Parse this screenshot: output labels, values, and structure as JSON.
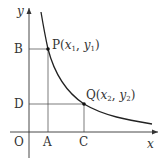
{
  "diagram": {
    "axis_labels": {
      "x": "x",
      "y": "y",
      "origin": "O"
    },
    "points": {
      "P": {
        "name": "P",
        "open": "(",
        "x": "x",
        "x_sub": "1",
        "sep": ", ",
        "y": "y",
        "y_sub": "1",
        "close": ")"
      },
      "Q": {
        "name": "Q",
        "open": "(",
        "x": "x",
        "x_sub": "2",
        "sep": ", ",
        "y": "y",
        "y_sub": "2",
        "close": ")"
      }
    },
    "tick_labels": {
      "A": "A",
      "B": "B",
      "C": "C",
      "D": "D"
    },
    "colors": {
      "axis": "#333333",
      "curve": "#222222",
      "guides": "#444444"
    }
  }
}
